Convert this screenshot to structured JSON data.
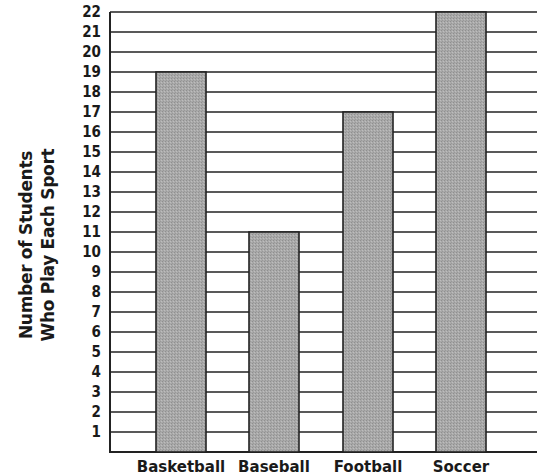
{
  "chart_data": {
    "type": "bar",
    "title": "",
    "categories": [
      "Basketball",
      "Baseball",
      "Football",
      "Soccer"
    ],
    "values": [
      19,
      11,
      17,
      22
    ],
    "xlabel": "",
    "ylabel": "Number of Students Who Play Each Sport",
    "ylabel_lines": [
      "Number of Students",
      "Who Play Each Sport"
    ],
    "yticks": [
      1,
      2,
      3,
      4,
      5,
      6,
      7,
      8,
      9,
      10,
      11,
      12,
      13,
      14,
      15,
      16,
      17,
      18,
      19,
      20,
      21,
      22
    ],
    "ylim": [
      0,
      22
    ],
    "grid": true,
    "legend": null,
    "bar_color": "#a6a6a6",
    "grid_color": "#222222"
  }
}
